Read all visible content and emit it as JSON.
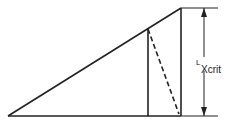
{
  "diagram": {
    "label_main": "L",
    "label_sub": "Xcrit",
    "colors": {
      "line": "#222222",
      "background": "#ffffff"
    }
  }
}
